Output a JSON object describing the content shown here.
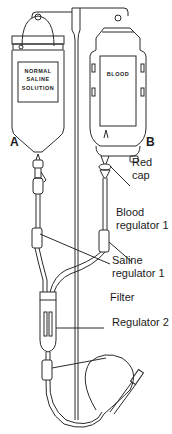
{
  "diagram": {
    "bags": {
      "saline": {
        "label_lines": [
          "NORMAL",
          "SALINE",
          "SOLUTION"
        ],
        "marker": "A"
      },
      "blood": {
        "label": "BLOOD",
        "marker": "B"
      }
    },
    "callouts": {
      "red_cap": [
        "Red",
        "cap"
      ],
      "blood_regulator": [
        "Blood",
        "regulator 1"
      ],
      "saline_regulator": [
        "Saline",
        "regulator 1"
      ],
      "filter": "Filter",
      "regulator_2": "Regulator 2"
    },
    "colors": {
      "line": "#2a2a2a",
      "background": "#ffffff"
    }
  }
}
